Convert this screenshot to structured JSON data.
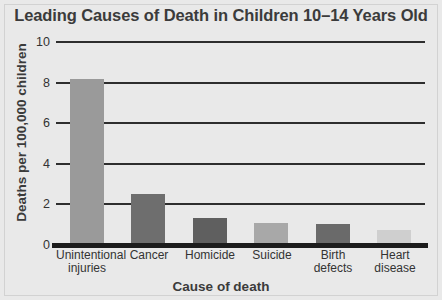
{
  "chart_data": {
    "type": "bar",
    "title": "Leading Causes of Death in Children 10–14 Years Old",
    "xlabel": "Cause of death",
    "ylabel": "Deaths per 100,000 children",
    "categories": [
      "Unintentional injuries",
      "Cancer",
      "Homicide",
      "Suicide",
      "Birth defects",
      "Heart disease"
    ],
    "category_lines": [
      [
        "Unintentional",
        "injuries"
      ],
      [
        "Cancer"
      ],
      [
        "Homicide"
      ],
      [
        "Suicide"
      ],
      [
        "Birth",
        "defects"
      ],
      [
        "Heart",
        "disease"
      ]
    ],
    "values": [
      8.2,
      2.5,
      1.35,
      1.1,
      1.05,
      0.75
    ],
    "bar_colors": [
      "#9a9a9a",
      "#6e6e6e",
      "#5f5f5f",
      "#a8a8a8",
      "#6a6a6a",
      "#cfcfcf"
    ],
    "ylim": [
      0,
      10
    ],
    "yticks": [
      0,
      2,
      4,
      6,
      8,
      10
    ],
    "ytick_labels": [
      "0",
      "2",
      "4",
      "6",
      "8",
      "10"
    ],
    "grid": true,
    "legend": "none"
  },
  "style": {
    "background": "#e9e9e9",
    "axis_color": "#1c1c1c",
    "grid_color": "#2e2e2e",
    "text_color": "#333333",
    "title_color": "#3b3b3b"
  }
}
